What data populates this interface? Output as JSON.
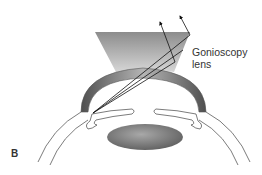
{
  "figure": {
    "panel_letter": "B",
    "labels": {
      "gonioscopy_lens_line1": "Gonioscopy",
      "gonioscopy_lens_line2": "lens"
    },
    "components": [
      "gonioscopy-lens",
      "cornea",
      "light-rays",
      "iris",
      "crystalline-lens",
      "sclera"
    ],
    "colors": {
      "lens_top": "#8a8a8a",
      "lens_bottom": "#d8d8d8",
      "cornea_dark": "#555555",
      "cornea_light": "#a8a8a8",
      "crystalline_lens_dark": "#666666",
      "crystalline_lens_light": "#a0a0a0",
      "outline": "#444444",
      "ray": "#111111"
    }
  }
}
